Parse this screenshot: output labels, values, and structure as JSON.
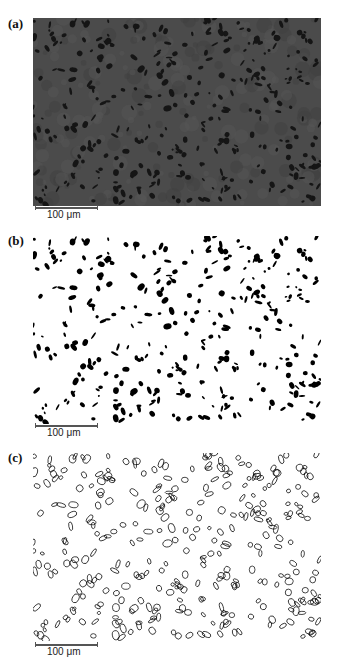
{
  "figure": {
    "panels": [
      {
        "label": "(a)",
        "type": "micrograph",
        "scale_bar_label": "100 μm",
        "background": "#4b4b4b",
        "particle_color": "#151515"
      },
      {
        "label": "(b)",
        "type": "binary",
        "scale_bar_label": "100 μm",
        "background": "#ffffff",
        "particle_color": "#000000"
      },
      {
        "label": "(c)",
        "type": "outline",
        "scale_bar_label": "100 μm",
        "background": "#ffffff",
        "particle_color": "#000000"
      }
    ]
  }
}
